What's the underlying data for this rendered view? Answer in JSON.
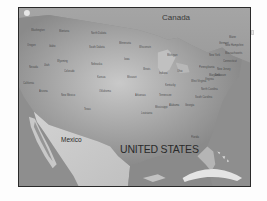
{
  "map": {
    "style": "grayscale",
    "countries": {
      "canada": "Canada",
      "mexico": "Mexico",
      "united_states": "UNITED STATES"
    },
    "state_labels": [
      {
        "name": "state-label-washington",
        "text": "Washington"
      },
      {
        "name": "state-label-montana",
        "text": "Montana"
      },
      {
        "name": "state-label-north-dakota",
        "text": "North Dakota"
      },
      {
        "name": "state-label-oregon",
        "text": "Oregon"
      },
      {
        "name": "state-label-idaho",
        "text": "Idaho"
      },
      {
        "name": "state-label-south-dakota",
        "text": "South Dakota"
      },
      {
        "name": "state-label-wyoming",
        "text": "Wyoming"
      },
      {
        "name": "state-label-minnesota",
        "text": "Minnesota"
      },
      {
        "name": "state-label-nebraska",
        "text": "Nebraska"
      },
      {
        "name": "state-label-nevada",
        "text": "Nevada"
      },
      {
        "name": "state-label-utah",
        "text": "Utah"
      },
      {
        "name": "state-label-colorado",
        "text": "Colorado"
      },
      {
        "name": "state-label-kansas",
        "text": "Kansas"
      },
      {
        "name": "state-label-california",
        "text": "California"
      },
      {
        "name": "state-label-arizona",
        "text": "Arizona"
      },
      {
        "name": "state-label-new-mexico",
        "text": "New Mexico"
      },
      {
        "name": "state-label-oklahoma",
        "text": "Oklahoma"
      },
      {
        "name": "state-label-texas",
        "text": "Texas"
      },
      {
        "name": "state-label-iowa",
        "text": "Iowa"
      },
      {
        "name": "state-label-missouri",
        "text": "Missouri"
      },
      {
        "name": "state-label-wisconsin",
        "text": "Wisconsin"
      },
      {
        "name": "state-label-illinois",
        "text": "Illinois"
      },
      {
        "name": "state-label-michigan",
        "text": "Michigan"
      },
      {
        "name": "state-label-indiana",
        "text": "Indiana"
      },
      {
        "name": "state-label-ohio",
        "text": "Ohio"
      },
      {
        "name": "state-label-kentucky",
        "text": "Kentucky"
      },
      {
        "name": "state-label-tennessee",
        "text": "Tennessee"
      },
      {
        "name": "state-label-arkansas",
        "text": "Arkansas"
      },
      {
        "name": "state-label-louisiana",
        "text": "Louisiana"
      },
      {
        "name": "state-label-mississippi",
        "text": "Mississippi"
      },
      {
        "name": "state-label-alabama",
        "text": "Alabama"
      },
      {
        "name": "state-label-georgia",
        "text": "Georgia"
      },
      {
        "name": "state-label-florida",
        "text": "Florida"
      },
      {
        "name": "state-label-south-carolina",
        "text": "South Carolina"
      },
      {
        "name": "state-label-north-carolina",
        "text": "North Carolina"
      },
      {
        "name": "state-label-virginia",
        "text": "Virginia"
      },
      {
        "name": "state-label-west-virginia",
        "text": "West Virginia"
      },
      {
        "name": "state-label-pennsylvania",
        "text": "Pennsylvania"
      },
      {
        "name": "state-label-new-york",
        "text": "New York"
      },
      {
        "name": "state-label-maine",
        "text": "Maine"
      },
      {
        "name": "state-label-new-hampshire",
        "text": "New Hampshire"
      },
      {
        "name": "state-label-vermont",
        "text": "Vermont"
      },
      {
        "name": "state-label-massachusetts",
        "text": "Massachusetts"
      },
      {
        "name": "state-label-connecticut",
        "text": "Connecticut"
      },
      {
        "name": "state-label-new-jersey",
        "text": "New Jersey"
      },
      {
        "name": "state-label-delaware",
        "text": "Delaware"
      },
      {
        "name": "state-label-maryland",
        "text": "Maryland"
      }
    ]
  }
}
